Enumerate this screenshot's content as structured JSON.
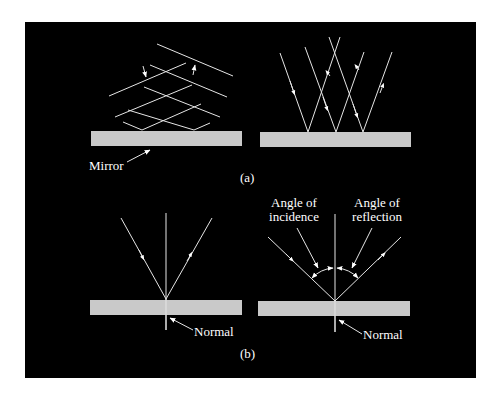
{
  "figure": {
    "panels": [
      {
        "id": "a",
        "caption": "(a)",
        "left": {
          "description": "Wavefronts of incident and reflected light crossing above a mirror",
          "label": "Mirror"
        },
        "right": {
          "description": "Three incident rays reflecting off a mirror"
        }
      },
      {
        "id": "b",
        "caption": "(b)",
        "left": {
          "description": "Single ray reflecting at the normal",
          "label": "Normal"
        },
        "right": {
          "description": "Ray with angles marked",
          "label_normal": "Normal",
          "label_incidence_line1": "Angle of",
          "label_incidence_line2": "incidence",
          "label_reflection_line1": "Angle of",
          "label_reflection_line2": "reflection"
        }
      }
    ],
    "colors": {
      "background": "#000000",
      "page": "#ffffff",
      "mirror": "#c9c9c9",
      "lines": "#e6e6e6"
    }
  }
}
